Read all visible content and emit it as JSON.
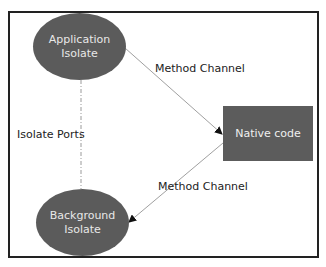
{
  "diagram": {
    "nodes": {
      "application_isolate": {
        "line1": "Application",
        "line2": "Isolate",
        "shape": "ellipse",
        "fill": "#5b5b5b"
      },
      "background_isolate": {
        "line1": "Background",
        "line2": "Isolate",
        "shape": "ellipse",
        "fill": "#5b5b5b"
      },
      "native_code": {
        "label": "Native code",
        "shape": "rectangle",
        "fill": "#5c5c5c"
      }
    },
    "edges": {
      "app_to_native": {
        "label": "Method Channel",
        "style": "solid-arrow"
      },
      "native_to_background": {
        "label": "Method Channel",
        "style": "solid-arrow"
      },
      "app_background_ports": {
        "label": "Isolate Ports",
        "style": "dash-dot"
      }
    },
    "colors": {
      "frame": "#222222",
      "edge": "#999999",
      "arrowhead": "#111111",
      "text": "#222222"
    }
  }
}
